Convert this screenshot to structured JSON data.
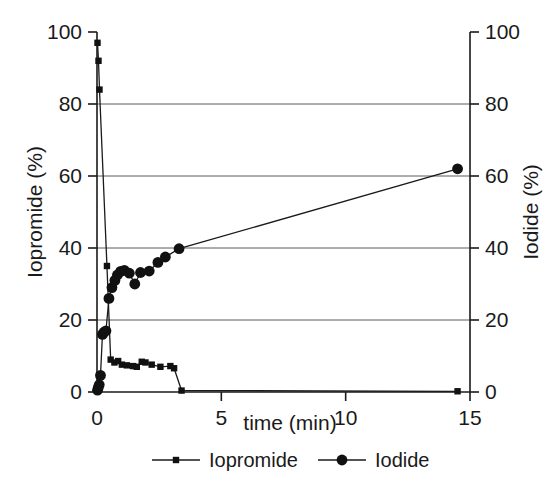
{
  "chart_data": {
    "type": "line",
    "title": "",
    "subtitle": "",
    "xlabel": "time (min)",
    "ylabel": "Iopromide (%)",
    "y2label": "Iodide (%)",
    "xlim": [
      0,
      15
    ],
    "ylim": [
      0,
      100
    ],
    "y2lim": [
      0,
      100
    ],
    "xticks": [
      0,
      5,
      10,
      15
    ],
    "xticklabels": [
      "0",
      "5",
      "10",
      "15"
    ],
    "yticks": [
      0,
      20,
      40,
      60,
      80,
      100
    ],
    "yticklabels": [
      "0",
      "20",
      "40",
      "60",
      "80",
      "100"
    ],
    "y2ticks": [
      0,
      20,
      40,
      60,
      80,
      100
    ],
    "y2ticklabels": [
      "0",
      "20",
      "40",
      "60",
      "80",
      "100"
    ],
    "grid": "horizontal",
    "legend_position": "bottom",
    "legend": [
      "Iopromide",
      "Iodide"
    ],
    "series": [
      {
        "name": "Iopromide",
        "marker": "square",
        "axis": "left",
        "points": [
          [
            0.02,
            97.0
          ],
          [
            0.06,
            92.0
          ],
          [
            0.1,
            84.0
          ],
          [
            0.4,
            35.0
          ],
          [
            0.55,
            9.0
          ],
          [
            0.7,
            8.2
          ],
          [
            0.85,
            8.6
          ],
          [
            1.0,
            7.6
          ],
          [
            1.2,
            7.4
          ],
          [
            1.45,
            7.2
          ],
          [
            1.6,
            7.0
          ],
          [
            1.8,
            8.4
          ],
          [
            1.95,
            8.2
          ],
          [
            2.2,
            7.6
          ],
          [
            2.55,
            7.0
          ],
          [
            2.95,
            7.2
          ],
          [
            3.1,
            6.6
          ],
          [
            3.4,
            0.4
          ],
          [
            14.5,
            0.2
          ]
        ]
      },
      {
        "name": "Iodide",
        "marker": "circle",
        "axis": "right",
        "points": [
          [
            0.02,
            0.5
          ],
          [
            0.05,
            1.2
          ],
          [
            0.09,
            2.0
          ],
          [
            0.14,
            4.6
          ],
          [
            0.22,
            16.0
          ],
          [
            0.28,
            16.6
          ],
          [
            0.36,
            17.0
          ],
          [
            0.48,
            26.0
          ],
          [
            0.6,
            29.0
          ],
          [
            0.72,
            31.0
          ],
          [
            0.82,
            32.5
          ],
          [
            0.95,
            33.5
          ],
          [
            1.1,
            33.8
          ],
          [
            1.3,
            33.0
          ],
          [
            1.52,
            30.0
          ],
          [
            1.75,
            33.2
          ],
          [
            2.1,
            33.6
          ],
          [
            2.45,
            36.0
          ],
          [
            2.75,
            37.5
          ],
          [
            3.3,
            39.8
          ],
          [
            14.5,
            62.0
          ]
        ]
      }
    ]
  },
  "axes": {
    "left_title": "Iopromide (%)",
    "right_title": "Iodide (%)",
    "bottom_title": "time (min)"
  },
  "legend": {
    "items": [
      {
        "label": "Iopromide",
        "marker": "square-marker"
      },
      {
        "label": "Iodide",
        "marker": "circle-marker"
      }
    ]
  }
}
